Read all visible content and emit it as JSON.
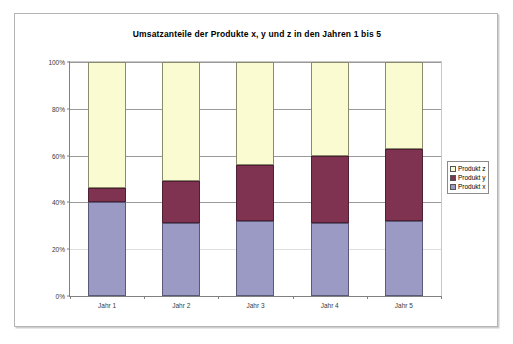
{
  "chart_data": {
    "type": "bar",
    "subtype": "stacked-100-percent",
    "title": "Umsatzanteile der Produkte x, y und z in den Jahren 1 bis 5",
    "xlabel": "",
    "ylabel": "",
    "categories": [
      "Jahr 1",
      "Jahr 2",
      "Jahr 3",
      "Jahr 4",
      "Jahr 5"
    ],
    "series": [
      {
        "name": "Produkt x",
        "color": "#9a9ac4",
        "values": [
          40,
          31,
          32,
          31,
          32
        ]
      },
      {
        "name": "Produkt y",
        "color": "#7f3351",
        "values": [
          6,
          18,
          24,
          29,
          31
        ]
      },
      {
        "name": "Produkt z",
        "color": "#fbfbd2",
        "values": [
          54,
          51,
          44,
          40,
          37
        ]
      }
    ],
    "stack_order_bottom_to_top": [
      "Produkt x",
      "Produkt y",
      "Produkt z"
    ],
    "ylim": [
      0,
      100
    ],
    "yticks": [
      0,
      20,
      40,
      60,
      80,
      100
    ],
    "ytick_labels": [
      "0%",
      "20%",
      "40%",
      "60%",
      "80%",
      "100%"
    ],
    "grid": true,
    "legend_position": "right",
    "legend_entries": [
      "Produkt z",
      "Produkt y",
      "Produkt x"
    ]
  },
  "legend": {
    "items": [
      {
        "label": "Produkt z",
        "color": "#fbfbd2"
      },
      {
        "label": "Produkt y",
        "color": "#7f3351"
      },
      {
        "label": "Produkt x",
        "color": "#9a9ac4"
      }
    ]
  }
}
